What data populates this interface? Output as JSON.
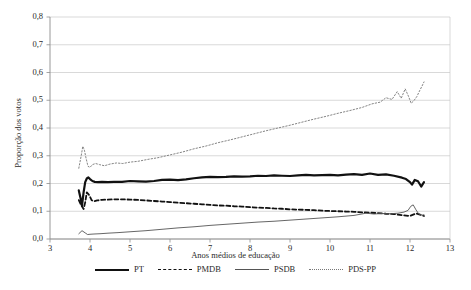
{
  "chart_data": {
    "type": "line",
    "title": "",
    "xlabel": "Anos médios de educação",
    "ylabel": "Proporção dos votos",
    "xlim": [
      3,
      13
    ],
    "ylim": [
      0.0,
      0.8
    ],
    "xticks": [
      "3",
      "4",
      "5",
      "6",
      "7",
      "8",
      "9",
      "10",
      "11",
      "12",
      "13"
    ],
    "yticks": [
      "0,0",
      "0,1",
      "0,2",
      "0,3",
      "0,4",
      "0,5",
      "0,6",
      "0,7",
      "0,8"
    ],
    "grid": "horizontal",
    "legend_position": "bottom",
    "series": [
      {
        "name": "PT",
        "style": "thick-solid",
        "color": "#111111",
        "x": [
          3.72,
          3.76,
          3.8,
          3.84,
          3.88,
          3.92,
          3.96,
          4.0,
          4.06,
          4.12,
          4.2,
          4.3,
          4.45,
          4.6,
          4.8,
          5.0,
          5.2,
          5.4,
          5.6,
          5.8,
          6.0,
          6.2,
          6.4,
          6.6,
          6.8,
          7.0,
          7.2,
          7.4,
          7.6,
          7.8,
          8.0,
          8.2,
          8.4,
          8.6,
          8.8,
          9.0,
          9.2,
          9.4,
          9.6,
          9.8,
          10.0,
          10.2,
          10.4,
          10.6,
          10.8,
          11.0,
          11.2,
          11.4,
          11.6,
          11.8,
          11.9,
          12.0,
          12.05,
          12.12,
          12.2,
          12.28,
          12.35
        ],
        "y": [
          0.175,
          0.15,
          0.12,
          0.168,
          0.205,
          0.218,
          0.222,
          0.216,
          0.209,
          0.206,
          0.205,
          0.206,
          0.205,
          0.206,
          0.206,
          0.209,
          0.208,
          0.207,
          0.209,
          0.213,
          0.214,
          0.212,
          0.215,
          0.219,
          0.222,
          0.224,
          0.223,
          0.224,
          0.226,
          0.225,
          0.226,
          0.228,
          0.227,
          0.229,
          0.228,
          0.227,
          0.229,
          0.231,
          0.229,
          0.23,
          0.231,
          0.229,
          0.232,
          0.234,
          0.231,
          0.236,
          0.231,
          0.233,
          0.228,
          0.221,
          0.216,
          0.205,
          0.196,
          0.213,
          0.208,
          0.189,
          0.205
        ]
      },
      {
        "name": "PMDB",
        "style": "dashed",
        "color": "#111111",
        "x": [
          3.72,
          3.78,
          3.84,
          3.88,
          3.92,
          3.98,
          4.04,
          4.1,
          4.18,
          4.3,
          4.45,
          4.6,
          4.8,
          5.0,
          5.2,
          5.4,
          5.6,
          5.8,
          6.0,
          6.2,
          6.4,
          6.6,
          6.8,
          7.0,
          7.2,
          7.4,
          7.6,
          7.8,
          8.0,
          8.2,
          8.4,
          8.6,
          8.8,
          9.0,
          9.2,
          9.4,
          9.6,
          9.8,
          10.0,
          10.2,
          10.4,
          10.6,
          10.8,
          11.0,
          11.2,
          11.4,
          11.6,
          11.8,
          12.0,
          12.15,
          12.3,
          12.35
        ],
        "y": [
          0.14,
          0.122,
          0.108,
          0.132,
          0.168,
          0.158,
          0.14,
          0.136,
          0.139,
          0.141,
          0.142,
          0.143,
          0.143,
          0.142,
          0.141,
          0.139,
          0.137,
          0.135,
          0.133,
          0.131,
          0.129,
          0.127,
          0.125,
          0.123,
          0.121,
          0.12,
          0.118,
          0.117,
          0.115,
          0.113,
          0.112,
          0.11,
          0.109,
          0.107,
          0.106,
          0.105,
          0.104,
          0.102,
          0.101,
          0.1,
          0.099,
          0.098,
          0.096,
          0.095,
          0.093,
          0.091,
          0.09,
          0.086,
          0.083,
          0.092,
          0.086,
          0.083
        ]
      },
      {
        "name": "PSDB",
        "style": "thin-solid",
        "color": "#555555",
        "x": [
          3.72,
          3.8,
          3.88,
          3.94,
          4.0,
          4.1,
          4.25,
          4.45,
          4.7,
          5.0,
          5.4,
          5.8,
          6.2,
          6.6,
          7.0,
          7.4,
          7.8,
          8.2,
          8.6,
          9.0,
          9.4,
          9.8,
          10.2,
          10.6,
          10.9,
          11.1,
          11.3,
          11.5,
          11.7,
          11.85,
          11.95,
          12.02,
          12.08,
          12.15,
          12.22,
          12.3,
          12.35
        ],
        "y": [
          0.019,
          0.03,
          0.022,
          0.016,
          0.017,
          0.018,
          0.019,
          0.021,
          0.023,
          0.026,
          0.03,
          0.035,
          0.04,
          0.044,
          0.049,
          0.053,
          0.057,
          0.061,
          0.064,
          0.068,
          0.072,
          0.076,
          0.08,
          0.085,
          0.093,
          0.09,
          0.092,
          0.091,
          0.093,
          0.097,
          0.103,
          0.118,
          0.123,
          0.105,
          0.09,
          0.086,
          0.087
        ]
      },
      {
        "name": "PDS-PP",
        "style": "dotted",
        "color": "#777777",
        "x": [
          3.72,
          3.78,
          3.82,
          3.86,
          3.9,
          3.95,
          4.0,
          4.06,
          4.14,
          4.24,
          4.36,
          4.5,
          4.66,
          4.82,
          5.0,
          5.2,
          5.45,
          5.7,
          6.0,
          6.3,
          6.6,
          6.9,
          7.2,
          7.5,
          7.8,
          8.1,
          8.4,
          8.7,
          9.0,
          9.3,
          9.6,
          9.9,
          10.2,
          10.5,
          10.8,
          11.05,
          11.25,
          11.4,
          11.55,
          11.68,
          11.78,
          11.88,
          11.96,
          12.03,
          12.1,
          12.17,
          12.24,
          12.3,
          12.35
        ],
        "y": [
          0.255,
          0.3,
          0.334,
          0.32,
          0.292,
          0.262,
          0.258,
          0.268,
          0.272,
          0.268,
          0.264,
          0.27,
          0.274,
          0.272,
          0.277,
          0.28,
          0.287,
          0.293,
          0.303,
          0.313,
          0.325,
          0.335,
          0.347,
          0.357,
          0.368,
          0.379,
          0.39,
          0.4,
          0.41,
          0.421,
          0.432,
          0.442,
          0.453,
          0.463,
          0.474,
          0.487,
          0.493,
          0.509,
          0.503,
          0.531,
          0.507,
          0.541,
          0.515,
          0.489,
          0.499,
          0.513,
          0.534,
          0.551,
          0.566
        ]
      }
    ]
  },
  "legend": {
    "items": [
      {
        "label": "PT",
        "key": "pt"
      },
      {
        "label": "PMDB",
        "key": "pmdb"
      },
      {
        "label": "PSDB",
        "key": "psdb"
      },
      {
        "label": "PDS-PP",
        "key": "pdspp"
      }
    ]
  }
}
